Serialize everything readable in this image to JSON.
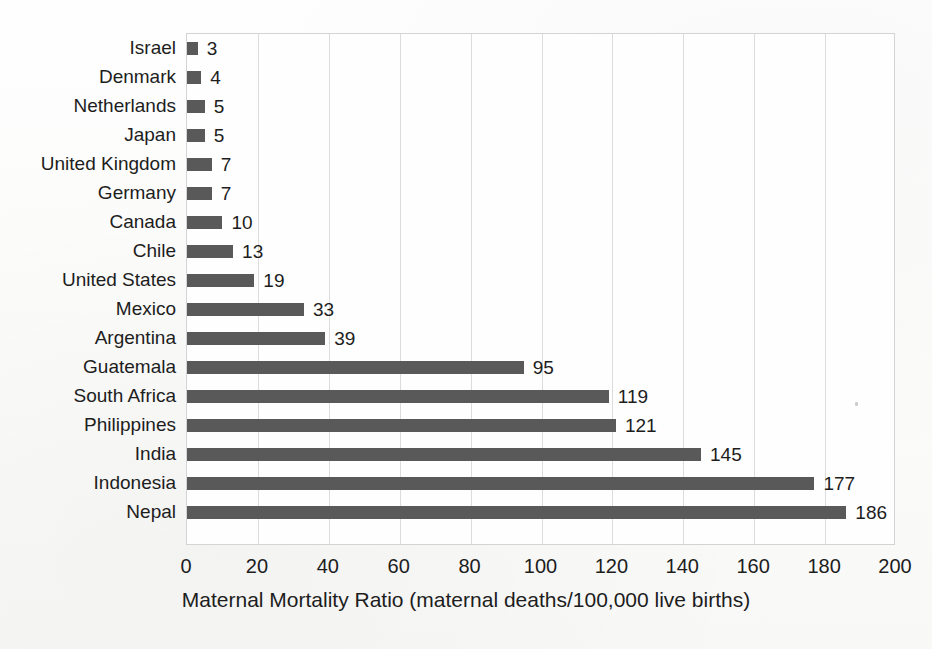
{
  "chart_data": {
    "type": "bar",
    "orientation": "horizontal",
    "title": "",
    "xlabel": "Maternal Mortality Ratio (maternal deaths/100,000 live births)",
    "ylabel": "",
    "xlim": [
      0,
      200
    ],
    "xticks": [
      0,
      20,
      40,
      60,
      80,
      100,
      120,
      140,
      160,
      180,
      200
    ],
    "grid": "vertical",
    "legend": "none",
    "bar_color": "#595959",
    "show_data_labels": true,
    "categories": [
      "Israel",
      "Denmark",
      "Netherlands",
      "Japan",
      "United Kingdom",
      "Germany",
      "Canada",
      "Chile",
      "United States",
      "Mexico",
      "Argentina",
      "Guatemala",
      "South Africa",
      "Philippines",
      "India",
      "Indonesia",
      "Nepal"
    ],
    "values": [
      3,
      4,
      5,
      5,
      7,
      7,
      10,
      13,
      19,
      33,
      39,
      95,
      119,
      121,
      145,
      177,
      186
    ],
    "value_labels": [
      "3",
      "4",
      "5",
      "5",
      "7",
      "7",
      "10",
      "13",
      "19",
      "33",
      "39",
      "95",
      "119",
      "121",
      "145",
      "177",
      "186"
    ]
  }
}
